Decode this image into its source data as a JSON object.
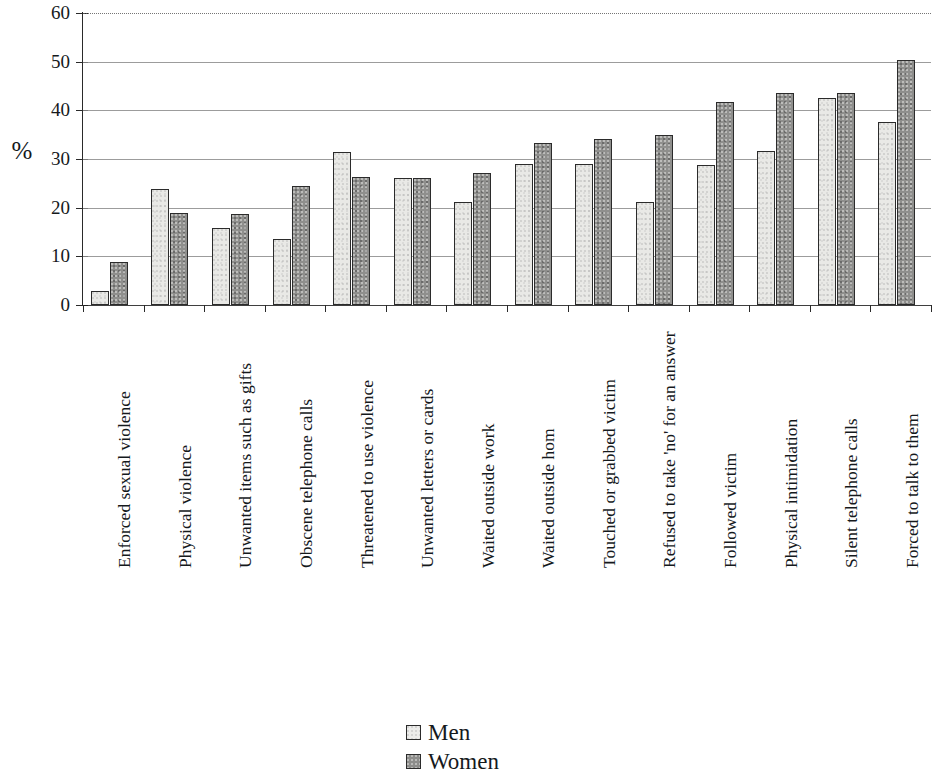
{
  "chart_data": {
    "type": "bar",
    "title": "",
    "subtitle": "",
    "xlabel": "",
    "ylabel": "%",
    "ylim": [
      0,
      60
    ],
    "ytick_values": [
      0,
      10,
      20,
      30,
      40,
      50,
      60
    ],
    "ytick_labels": [
      "0",
      "10",
      "20",
      "30",
      "40",
      "50",
      "60"
    ],
    "grid": true,
    "grid_axis": "y",
    "legend_position": "bottom-center",
    "orientation": "vertical",
    "grouping": "grouped",
    "categories": [
      "Enforced sexual violence",
      "Physical violence",
      "Unwanted items such as gifts",
      "Obscene telephone calls",
      "Threatened to use violence",
      "Unwanted letters or cards",
      "Waited outside work",
      "Waited outside hom",
      "Touched or grabbed victim",
      "Refused to take 'no' for an answer",
      "Followed victim",
      "Physical intimidation",
      "Silent telephone calls",
      "Forced to talk to them"
    ],
    "series": [
      {
        "name": "Men",
        "color": "#e9e9e6",
        "values": [
          2.9,
          23.8,
          15.8,
          13.6,
          31.5,
          26.2,
          21.2,
          29.0,
          28.9,
          21.1,
          28.7,
          31.7,
          42.6,
          37.6
        ]
      },
      {
        "name": "Women",
        "color": "#8f8f8d",
        "values": [
          8.8,
          18.9,
          18.8,
          24.5,
          26.3,
          26.2,
          27.2,
          33.2,
          34.2,
          35.0,
          41.7,
          43.6,
          43.5,
          50.4
        ]
      }
    ]
  },
  "legend": {
    "items": [
      {
        "label": "Men",
        "swatch": "men"
      },
      {
        "label": "Women",
        "swatch": "women"
      }
    ]
  },
  "axis": {
    "y_title": "%"
  }
}
